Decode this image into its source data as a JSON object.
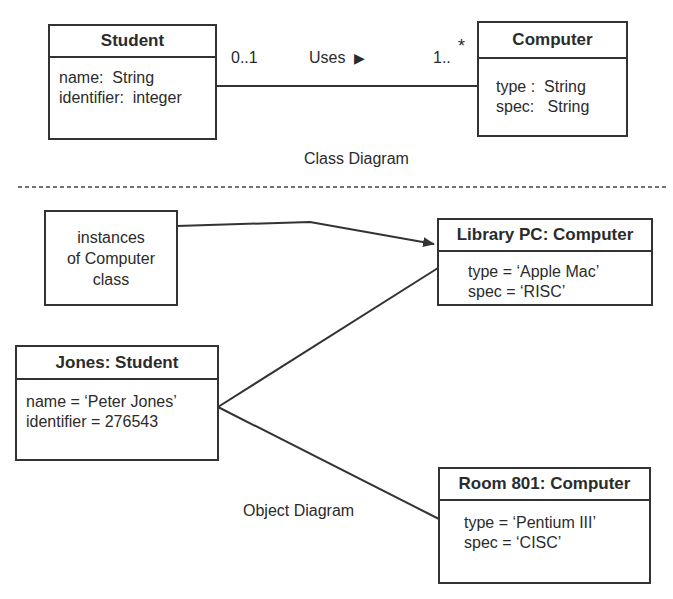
{
  "class_diagram": {
    "caption": "Class Diagram",
    "student_class": {
      "name": "Student",
      "attributes": [
        "name:  String",
        "identifier:  integer"
      ]
    },
    "computer_class": {
      "name": "Computer",
      "attributes": [
        "type :  String",
        "spec:   String"
      ]
    },
    "association": {
      "label": "Uses",
      "direction_icon": "▶",
      "student_multiplicity": "0..1",
      "computer_multiplicity": "1..",
      "computer_multiplicity_star": "*"
    }
  },
  "object_diagram": {
    "caption": "Object Diagram",
    "note": {
      "lines": [
        "instances",
        "of Computer",
        "class"
      ]
    },
    "jones": {
      "name": "Jones: Student",
      "attributes": [
        "name = ‘Peter Jones’",
        "identifier = 276543"
      ]
    },
    "library_pc": {
      "name": "Library PC: Computer",
      "attributes": [
        "type = ‘Apple Mac’",
        "spec = ‘RISC’"
      ]
    },
    "room_801": {
      "name": "Room 801: Computer",
      "attributes": [
        "type = ‘Pentium III’",
        "spec = ‘CISC’"
      ]
    }
  },
  "colors": {
    "line": "#333333",
    "text": "#2b2b2b",
    "background": "#ffffff"
  }
}
